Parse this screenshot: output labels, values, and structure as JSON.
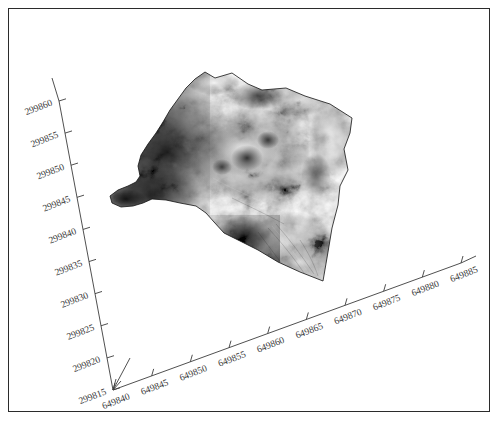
{
  "figure": {
    "type": "surface-3d",
    "title": "",
    "background_color": "#ffffff",
    "border_color": "#2b2b2b",
    "colormap": "grayscale"
  },
  "axes": {
    "x": {
      "name": "easting-axis",
      "ticks": [
        "649840",
        "649845",
        "649850",
        "649855",
        "649860",
        "649865",
        "649870",
        "649875",
        "649880",
        "649885"
      ],
      "min": 649840,
      "max": 649885,
      "step": 5,
      "label": "",
      "has_arrow": true
    },
    "y": {
      "name": "northing-axis",
      "ticks": [
        "299815",
        "299820",
        "299825",
        "299830",
        "299835",
        "299840",
        "299845",
        "299850",
        "299855",
        "299860"
      ],
      "min": 299815,
      "max": 299860,
      "step": 5,
      "label": "",
      "has_arrow": true
    }
  },
  "chart_data": {
    "type": "surface",
    "title": "",
    "xlabel": "",
    "ylabel": "",
    "xlim": [
      649840,
      649885
    ],
    "ylim": [
      299815,
      299860
    ],
    "grid": false,
    "legend": null,
    "colormap": "gray",
    "x_ticks": [
      "649840",
      "649845",
      "649850",
      "649855",
      "649860",
      "649865",
      "649870",
      "649875",
      "649880",
      "649885"
    ],
    "y_ticks": [
      "299815",
      "299820",
      "299825",
      "299830",
      "299835",
      "299840",
      "299845",
      "299850",
      "299855",
      "299860"
    ]
  }
}
